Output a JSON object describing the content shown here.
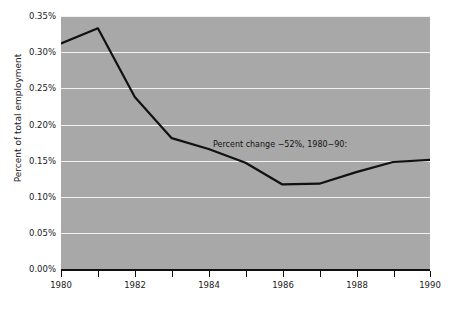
{
  "chart_data": {
    "type": "line",
    "title": "",
    "xlabel": "",
    "ylabel": "Percent of total employment",
    "xlim": [
      1980,
      1990
    ],
    "ylim": [
      0.0,
      0.35
    ],
    "grid": true,
    "legend": false,
    "x": [
      1980,
      1981,
      1982,
      1983,
      1984,
      1985,
      1986,
      1987,
      1988,
      1989,
      1990
    ],
    "values": [
      0.312,
      0.333,
      0.238,
      0.181,
      0.166,
      0.147,
      0.117,
      0.118,
      0.134,
      0.148,
      0.151
    ],
    "series": [
      {
        "name": "Percent of total employment",
        "values": [
          0.312,
          0.333,
          0.238,
          0.181,
          0.166,
          0.147,
          0.117,
          0.118,
          0.134,
          0.148,
          0.151
        ]
      }
    ],
    "y_ticks": [
      0.0,
      0.05,
      0.1,
      0.15,
      0.2,
      0.25,
      0.3,
      0.35
    ],
    "y_tick_labels": [
      "0.00%",
      "0.05%",
      "0.10%",
      "0.15%",
      "0.20%",
      "0.25%",
      "0.30%",
      "0.35%"
    ],
    "x_ticks": [
      1980,
      1981,
      1982,
      1983,
      1984,
      1985,
      1986,
      1987,
      1988,
      1989,
      1990
    ],
    "x_tick_labels": [
      "1980",
      "",
      "1982",
      "",
      "1984",
      "",
      "1986",
      "",
      "1988",
      "",
      "1990"
    ],
    "x_major_labels": [
      "1980",
      "1982",
      "1984",
      "1986",
      "1988",
      "1990"
    ],
    "annotations": [
      {
        "text": "Percent change −52%, 1980−90:",
        "x": 1985,
        "y": 0.185
      }
    ],
    "colors": {
      "line": "#111111",
      "plot_background": "#a8a8a8",
      "gridline": "#f2f2f2",
      "axis": "#111111",
      "text": "#1a1a1a",
      "figure_background": "#ffffff"
    }
  }
}
